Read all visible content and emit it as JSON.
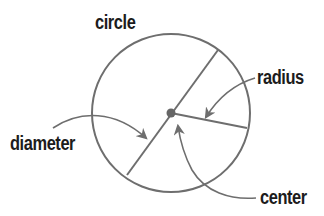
{
  "labels": {
    "circle": "circle",
    "radius": "radius",
    "diameter": "diameter",
    "center": "center"
  },
  "colors": {
    "stroke": "#6e6e6e",
    "text": "#1c1c1c",
    "background": "#ffffff"
  },
  "geometry": {
    "center": [
      170,
      113
    ],
    "radius": 79
  }
}
